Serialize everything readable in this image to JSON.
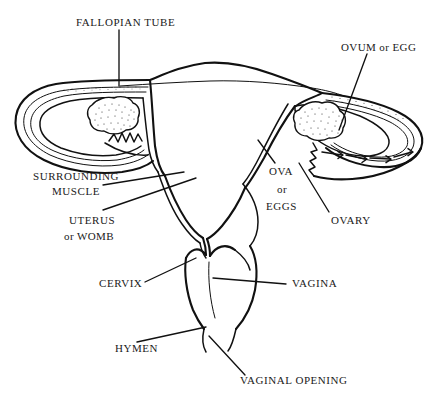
{
  "figure": {
    "kind": "anatomical-line-diagram",
    "background_color": "#ffffff",
    "ink_color": "#111111"
  },
  "labels": {
    "fallopian_tube": "FALLOPIAN TUBE",
    "ovum_or_egg": "OVUM or EGG",
    "surrounding": "SURROUNDING",
    "muscle": "MUSCLE",
    "uterus": "UTERUS",
    "or_womb": "or WOMB",
    "ova": "OVA",
    "or": "or",
    "eggs": "EGGS",
    "ovary": "OVARY",
    "cervix": "CERVIX",
    "vagina": "VAGINA",
    "hymen": "HYMEN",
    "vaginal_opening": "VAGINAL OPENING"
  },
  "parts": [
    {
      "id": "fallopian-tube-left",
      "name": "left fallopian tube"
    },
    {
      "id": "fallopian-tube-right",
      "name": "right fallopian tube"
    },
    {
      "id": "ovary-left",
      "name": "left ovary"
    },
    {
      "id": "ovary-right",
      "name": "right ovary"
    },
    {
      "id": "uterus-body",
      "name": "uterus or womb"
    },
    {
      "id": "cervix",
      "name": "cervix"
    },
    {
      "id": "vagina",
      "name": "vagina"
    },
    {
      "id": "hymen",
      "name": "hymen"
    },
    {
      "id": "vaginal-opening",
      "name": "vaginal opening"
    },
    {
      "id": "fimbriae",
      "name": "fimbriae and egg path arrows"
    }
  ]
}
